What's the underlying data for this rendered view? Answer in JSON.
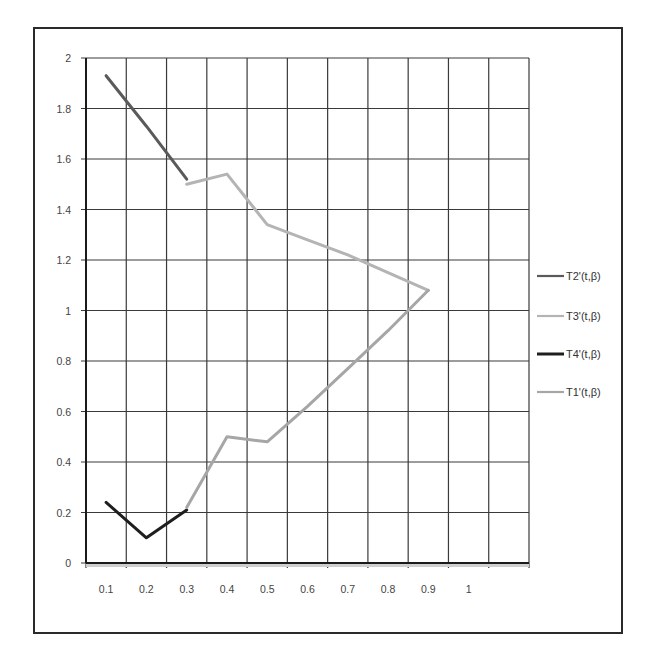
{
  "chart_data": {
    "type": "line",
    "title": "",
    "xlabel": "",
    "ylabel": "",
    "categories": [
      "0.1",
      "0.2",
      "0.3",
      "0.4",
      "0.5",
      "0.6",
      "0.7",
      "0.8",
      "0.9",
      "1",
      ""
    ],
    "ylim": [
      0,
      2
    ],
    "y_ticks": [
      "0",
      "0.2",
      "0.4",
      "0.6",
      "0.8",
      "1",
      "1.2",
      "1.4",
      "1.6",
      "1.8",
      "2"
    ],
    "grid": true,
    "legend_position": "right",
    "series": [
      {
        "name": "T2'(t,β)",
        "color": "#5a5a5a",
        "width": 3,
        "values": [
          1.93,
          1.73,
          1.52,
          null,
          null,
          null,
          null,
          null,
          null,
          null,
          null
        ]
      },
      {
        "name": "T3'(t,β)",
        "color": "#b4b4b4",
        "width": 3,
        "values": [
          null,
          null,
          1.5,
          1.54,
          1.34,
          1.28,
          1.22,
          1.15,
          1.08,
          null,
          null
        ]
      },
      {
        "name": "T4'(t,β)",
        "color": "#1e1e1e",
        "width": 3,
        "values": [
          0.24,
          0.1,
          0.21,
          null,
          null,
          null,
          null,
          null,
          null,
          null,
          null
        ]
      },
      {
        "name": "T1'(t,β)",
        "color": "#a6a6a6",
        "width": 3,
        "values": [
          null,
          null,
          0.22,
          0.5,
          0.48,
          0.62,
          0.77,
          0.92,
          1.08,
          null,
          null
        ]
      }
    ]
  },
  "legend": {
    "items": [
      {
        "label": "T2'(t,β)"
      },
      {
        "label": "T3'(t,β)"
      },
      {
        "label": "T4'(t,β)"
      },
      {
        "label": "T1'(t,β)"
      }
    ]
  }
}
